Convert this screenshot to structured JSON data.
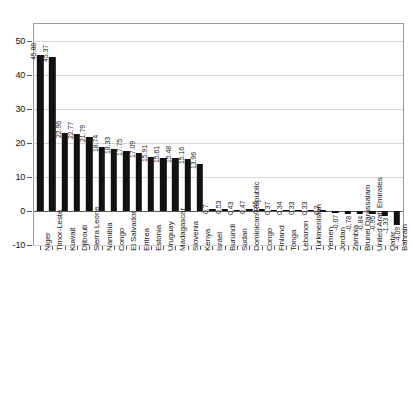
{
  "chart_data": {
    "type": "bar",
    "title": "",
    "subtitle": "",
    "xlabel": "",
    "ylabel": "",
    "grid": true,
    "legend": false,
    "orientation": "vertical",
    "bar_color": "#111111",
    "ylim": [
      -10,
      55
    ],
    "yticks": [
      -10,
      0,
      10,
      20,
      30,
      40,
      50
    ],
    "ytick_labels": [
      "-10",
      "0",
      "10",
      "20",
      "30",
      "40",
      "50"
    ],
    "categories": [
      "Niger",
      "Timor-Leste",
      "Kuwait",
      "Djibouti",
      "Sierra Leone",
      "Namibia",
      "Congo",
      "El Salvador",
      "Eritrea",
      "Estonia",
      "Uruguay",
      "Madagascar",
      "Slovenia",
      "Kenya",
      "Israel",
      "Burundi",
      "Sudan",
      "Dominican Republic",
      "Congo",
      "Finland",
      "Tonga",
      "Lebanon",
      "Turkmenistan",
      "Yemen",
      "Jordan",
      "Zambia",
      "Brunei Darussalam",
      "United Arab Emirates",
      "Qatar",
      "Bahrain"
    ],
    "values": [
      45.88,
      45.37,
      22.96,
      22.77,
      21.79,
      18.74,
      18.33,
      17.75,
      17.09,
      15.91,
      15.61,
      15.48,
      15.16,
      13.96,
      0.7,
      0.53,
      0.43,
      0.47,
      0.45,
      0.37,
      0.34,
      0.33,
      0.33,
      0.2,
      -0.07,
      -0.78,
      -0.84,
      -0.95,
      -1.33,
      -4.09
    ],
    "value_labels": [
      "45.88",
      "45.37",
      "22.96",
      "22.77",
      "21.79",
      "18.74",
      "18.33",
      "17.75",
      "17.09",
      "15.91",
      "15.61",
      "15.48",
      "15.16",
      "13.96",
      "0.7",
      "0.53",
      "0.43",
      "0.47",
      "0.45",
      "0.37",
      "0.34",
      "0.33",
      "0.33",
      "0.2",
      "-0.07",
      "-0.78",
      "-0.84",
      "-0.95",
      "-1.33",
      "-4.09"
    ]
  }
}
